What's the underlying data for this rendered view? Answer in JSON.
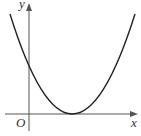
{
  "figure": {
    "type": "function-graph",
    "axes": {
      "x_label": "x",
      "y_label": "y",
      "origin_label": "O"
    },
    "curve": {
      "kind": "parabola",
      "opens": "up",
      "vertex_on_x_axis": true,
      "vertex_position": "right of origin",
      "y_intercept": "positive"
    },
    "colors": {
      "axis": "#555555",
      "curve": "#222222",
      "label": "#333333"
    }
  }
}
